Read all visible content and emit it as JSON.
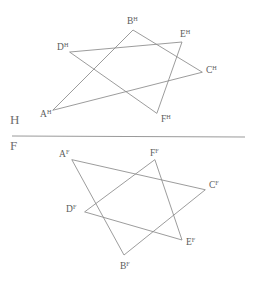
{
  "drawing": {
    "title": "Two-view orthographic projection of triangles ABC and DEF",
    "background_color": "#ffffff",
    "line_color": "#8a8a8a",
    "ground_line_color": "#9a9a9a",
    "label_color": "#5c5c5c",
    "width": 255,
    "height": 282
  },
  "ground_line": {
    "label_above": "H",
    "label_below": "F",
    "x1": 12,
    "y1": 136,
    "x2": 245,
    "y2": 137,
    "label_above_x": 10,
    "label_above_y": 124,
    "label_below_x": 10,
    "label_below_y": 150
  },
  "views": [
    {
      "name": "horizontal-projection",
      "plane": "H",
      "superscript": "H",
      "triangles": [
        {
          "name": "triangle-abc",
          "vertices": [
            "A",
            "B",
            "C"
          ],
          "points": "53,110 133,30 202,72"
        },
        {
          "name": "triangle-def",
          "vertices": [
            "D",
            "E",
            "F"
          ],
          "points": "70,52 182,42 157,113"
        }
      ],
      "labels": [
        {
          "name": "vertex-label-a",
          "base": "A",
          "sup": "H",
          "x": 40,
          "y": 117
        },
        {
          "name": "vertex-label-b",
          "base": "B",
          "sup": "H",
          "x": 127,
          "y": 24
        },
        {
          "name": "vertex-label-c",
          "base": "C",
          "sup": "H",
          "x": 206,
          "y": 73
        },
        {
          "name": "vertex-label-d",
          "base": "D",
          "sup": "H",
          "x": 57,
          "y": 50
        },
        {
          "name": "vertex-label-e",
          "base": "E",
          "sup": "H",
          "x": 180,
          "y": 37
        },
        {
          "name": "vertex-label-f",
          "base": "F",
          "sup": "H",
          "x": 161,
          "y": 122
        }
      ]
    },
    {
      "name": "frontal-projection",
      "plane": "F",
      "superscript": "F",
      "triangles": [
        {
          "name": "triangle-abc",
          "vertices": [
            "A",
            "B",
            "C"
          ],
          "points": "72,160 124,255 205,190"
        },
        {
          "name": "triangle-def",
          "vertices": [
            "D",
            "E",
            "F"
          ],
          "points": "85,212 182,240 155,160"
        }
      ],
      "labels": [
        {
          "name": "vertex-label-a",
          "base": "A",
          "sup": "F",
          "x": 59,
          "y": 157
        },
        {
          "name": "vertex-label-b",
          "base": "B",
          "sup": "F",
          "x": 120,
          "y": 269
        },
        {
          "name": "vertex-label-c",
          "base": "C",
          "sup": "F",
          "x": 209,
          "y": 188
        },
        {
          "name": "vertex-label-d",
          "base": "D",
          "sup": "F",
          "x": 66,
          "y": 212
        },
        {
          "name": "vertex-label-e",
          "base": "E",
          "sup": "F",
          "x": 186,
          "y": 245
        },
        {
          "name": "vertex-label-f",
          "base": "F",
          "sup": "F",
          "x": 150,
          "y": 156
        }
      ]
    }
  ]
}
